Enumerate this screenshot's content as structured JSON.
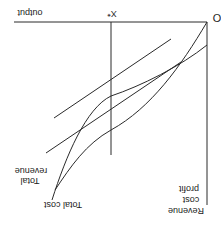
{
  "figure": {
    "orientation": "rotated-180",
    "origin_label": "O",
    "x_axis_label": "output",
    "x_star_label": "X*",
    "y_axis_label_lines": [
      "Revenue",
      "cost",
      "profit"
    ],
    "curves": [
      {
        "name": "Total revenue",
        "label_lines": [
          "Total",
          "revenue"
        ]
      },
      {
        "name": "Total cost",
        "label_lines": [
          "Total cost"
        ]
      }
    ],
    "line_color": "#2a2a2a",
    "background": "#ffffff"
  }
}
